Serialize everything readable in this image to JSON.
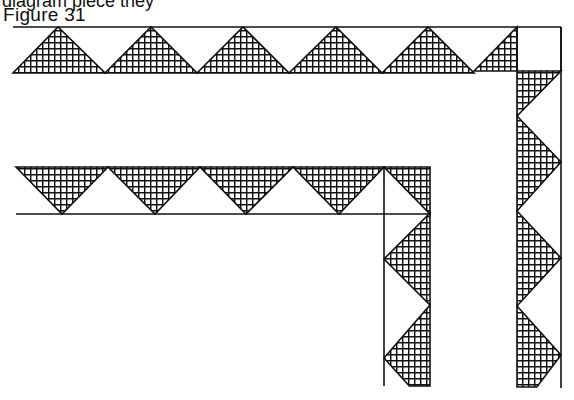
{
  "page": {
    "cut_off_text": "diagram piece they",
    "figure_label": "Figure 31"
  },
  "colors": {
    "ink": "#111111",
    "paper": "#ffffff"
  },
  "figure": {
    "top_border": {
      "top_line_y": 27,
      "bottom_y": 73,
      "x_start": 13,
      "corner_x0": 517,
      "corner_x1": 561,
      "apex_xs": [
        58,
        151,
        243,
        336,
        428
      ],
      "valley_xs": [
        13,
        105,
        197,
        289,
        382,
        474
      ]
    },
    "right_column": {
      "x0": 517,
      "x1": 561,
      "y_top": 71,
      "y_end": 387,
      "left_apex_ys": [
        116,
        211,
        306
      ],
      "right_tip_ys": [
        71,
        162,
        258,
        355
      ]
    },
    "lower_border": {
      "top_y": 167,
      "bottom_line_y": 214,
      "x_start": 16,
      "corner_x0": 384,
      "corner_x1": 430,
      "down_apex_xs": [
        62,
        155,
        246,
        339
      ],
      "top_xs": [
        16,
        108,
        200,
        293,
        384
      ]
    },
    "lower_column": {
      "x0": 384,
      "x1": 430,
      "y_top": 214,
      "y_end": 386,
      "left_apex_ys": [
        259,
        358
      ],
      "right_tip_ys": [
        213,
        305
      ]
    }
  }
}
